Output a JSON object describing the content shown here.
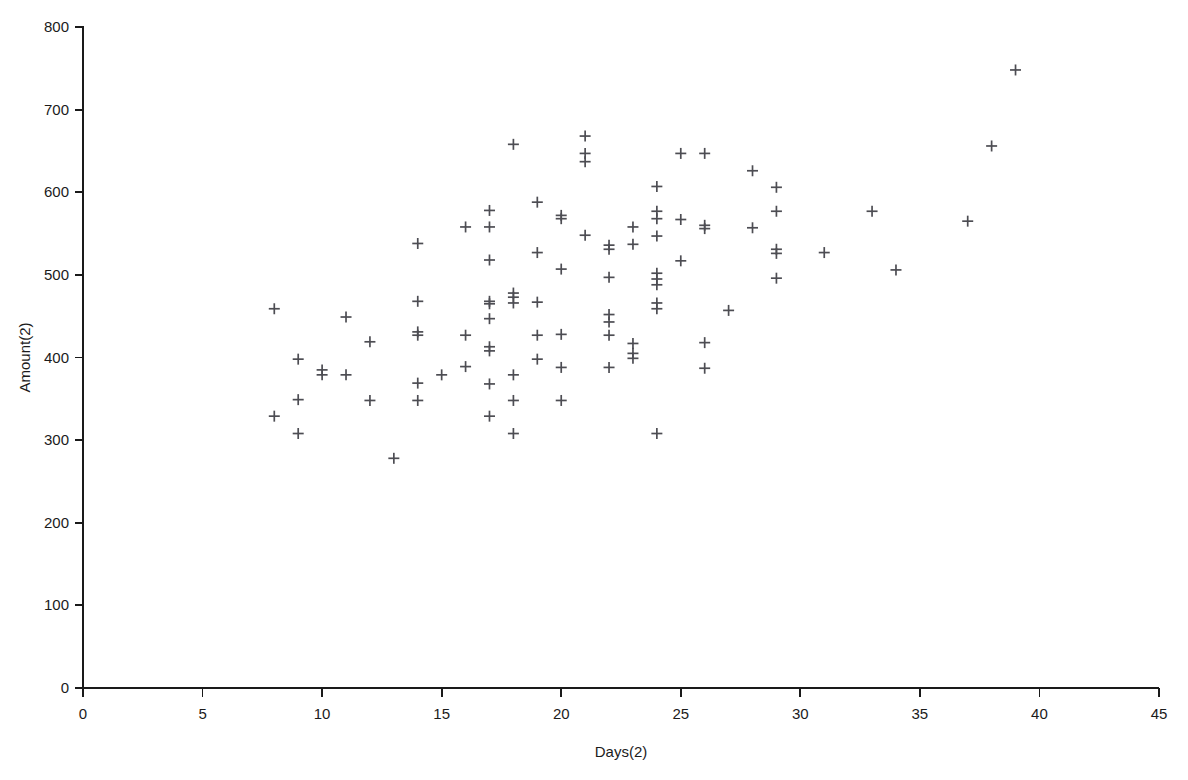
{
  "chart_data": {
    "type": "scatter",
    "title": "",
    "subtitle": "",
    "xlabel": "Days(2)",
    "ylabel": "Amount(2)",
    "xlim": [
      0,
      45
    ],
    "ylim": [
      0,
      800
    ],
    "xticks": [
      0,
      5,
      10,
      15,
      20,
      25,
      30,
      35,
      40,
      45
    ],
    "yticks": [
      0,
      100,
      200,
      300,
      400,
      500,
      600,
      700,
      800
    ],
    "xtick_labels": [
      "0",
      "5",
      "10",
      "15",
      "20",
      "25",
      "30",
      "35",
      "40",
      "45"
    ],
    "ytick_labels": [
      "0",
      "100",
      "200",
      "300",
      "400",
      "500",
      "600",
      "700",
      "800"
    ],
    "grid": false,
    "legend": false,
    "legend_position": "none",
    "marker": "plus",
    "marker_color": "#4d4d53",
    "marker_size": 11,
    "axis_color": "#1a1a1a",
    "background_color": "#ffffff",
    "series": [
      {
        "name": "Amount(2) vs Days(2)",
        "points": [
          [
            8,
            459
          ],
          [
            8,
            329
          ],
          [
            9,
            398
          ],
          [
            9,
            349
          ],
          [
            9,
            308
          ],
          [
            10,
            385
          ],
          [
            10,
            379
          ],
          [
            11,
            379
          ],
          [
            11,
            449
          ],
          [
            12,
            419
          ],
          [
            12,
            348
          ],
          [
            13,
            278
          ],
          [
            14,
            538
          ],
          [
            14,
            468
          ],
          [
            14,
            431
          ],
          [
            14,
            427
          ],
          [
            14,
            369
          ],
          [
            14,
            348
          ],
          [
            15,
            379
          ],
          [
            16,
            558
          ],
          [
            16,
            427
          ],
          [
            16,
            389
          ],
          [
            17,
            578
          ],
          [
            17,
            558
          ],
          [
            17,
            518
          ],
          [
            17,
            468
          ],
          [
            17,
            465
          ],
          [
            17,
            447
          ],
          [
            17,
            408
          ],
          [
            17,
            413
          ],
          [
            17,
            368
          ],
          [
            17,
            329
          ],
          [
            18,
            658
          ],
          [
            18,
            478
          ],
          [
            18,
            473
          ],
          [
            18,
            466
          ],
          [
            18,
            379
          ],
          [
            18,
            348
          ],
          [
            18,
            308
          ],
          [
            19,
            588
          ],
          [
            19,
            527
          ],
          [
            19,
            467
          ],
          [
            19,
            427
          ],
          [
            19,
            398
          ],
          [
            20,
            572
          ],
          [
            20,
            568
          ],
          [
            20,
            507
          ],
          [
            20,
            428
          ],
          [
            20,
            388
          ],
          [
            20,
            348
          ],
          [
            21,
            668
          ],
          [
            21,
            647
          ],
          [
            21,
            637
          ],
          [
            21,
            548
          ],
          [
            22,
            536
          ],
          [
            22,
            531
          ],
          [
            22,
            497
          ],
          [
            22,
            452
          ],
          [
            22,
            443
          ],
          [
            22,
            427
          ],
          [
            22,
            388
          ],
          [
            23,
            558
          ],
          [
            23,
            537
          ],
          [
            23,
            417
          ],
          [
            23,
            405
          ],
          [
            23,
            399
          ],
          [
            24,
            607
          ],
          [
            24,
            577
          ],
          [
            24,
            568
          ],
          [
            24,
            547
          ],
          [
            24,
            502
          ],
          [
            24,
            495
          ],
          [
            24,
            488
          ],
          [
            24,
            466
          ],
          [
            24,
            459
          ],
          [
            24,
            308
          ],
          [
            25,
            647
          ],
          [
            25,
            567
          ],
          [
            25,
            517
          ],
          [
            26,
            647
          ],
          [
            26,
            560
          ],
          [
            26,
            556
          ],
          [
            26,
            418
          ],
          [
            26,
            387
          ],
          [
            27,
            457
          ],
          [
            28,
            626
          ],
          [
            28,
            557
          ],
          [
            29,
            606
          ],
          [
            29,
            577
          ],
          [
            29,
            531
          ],
          [
            29,
            526
          ],
          [
            29,
            496
          ],
          [
            31,
            527
          ],
          [
            33,
            577
          ],
          [
            34,
            506
          ],
          [
            37,
            565
          ],
          [
            38,
            656
          ],
          [
            39,
            748
          ]
        ]
      }
    ]
  },
  "axes": {
    "x_title": "Days(2)",
    "y_title": "Amount(2)"
  }
}
